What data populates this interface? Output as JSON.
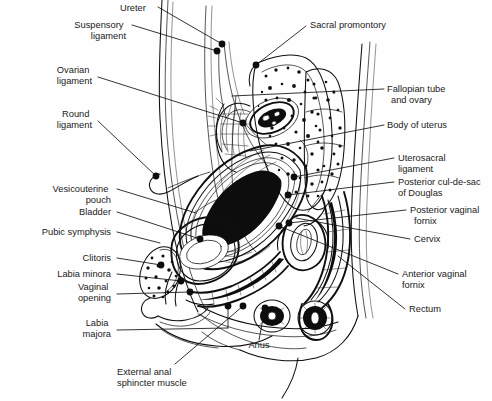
{
  "figure": {
    "caption_partial": "",
    "width": 492,
    "height": 401,
    "ink_color": "#0f0f0f",
    "background_color": "#fefefe",
    "text_color": "#1a1a1a"
  },
  "labels_left": [
    {
      "id": "suspensory-ligament",
      "lines": [
        "Suspensory",
        "ligament"
      ],
      "x": 126,
      "y": 28,
      "anchor": "end"
    },
    {
      "id": "ovarian-ligament",
      "lines": [
        "Ovarian",
        "ligament"
      ],
      "x": 92,
      "y": 73,
      "anchor": "end"
    },
    {
      "id": "round-ligament",
      "lines": [
        "Round",
        "ligament"
      ],
      "x": 92,
      "y": 117,
      "anchor": "end"
    },
    {
      "id": "vesicouterine-pouch",
      "lines": [
        "Vesicouterine",
        "pouch"
      ],
      "x": 111,
      "y": 192,
      "anchor": "end"
    },
    {
      "id": "bladder",
      "lines": [
        "Bladder"
      ],
      "x": 111,
      "y": 215,
      "anchor": "end"
    },
    {
      "id": "pubic-symphysis",
      "lines": [
        "Pubic symphysis"
      ],
      "x": 111,
      "y": 235,
      "anchor": "end"
    },
    {
      "id": "clitoris",
      "lines": [
        "Clitoris"
      ],
      "x": 111,
      "y": 261,
      "anchor": "end"
    },
    {
      "id": "labia-minora",
      "lines": [
        "Labia minora"
      ],
      "x": 111,
      "y": 277,
      "anchor": "end"
    },
    {
      "id": "vaginal-opening",
      "lines": [
        "Vaginal",
        "opening"
      ],
      "x": 111,
      "y": 290,
      "anchor": "end"
    },
    {
      "id": "labia-majora",
      "lines": [
        "Labia",
        "majora"
      ],
      "x": 111,
      "y": 326,
      "anchor": "end"
    }
  ],
  "labels_top": [
    {
      "id": "ureter",
      "lines": [
        "Ureter"
      ],
      "x": 120,
      "y": 11,
      "anchor": "start"
    },
    {
      "id": "sacral-promontory",
      "lines": [
        "Sacral promontory"
      ],
      "x": 310,
      "y": 28,
      "anchor": "start"
    }
  ],
  "labels_right": [
    {
      "id": "fallopian-tube-and-ovary",
      "lines": [
        "Fallopian tube",
        "and ovary"
      ],
      "x": 387,
      "y": 92,
      "anchor": "start"
    },
    {
      "id": "body-of-uterus",
      "lines": [
        "Body of uterus"
      ],
      "x": 387,
      "y": 128,
      "anchor": "start"
    },
    {
      "id": "uterosacral-ligament",
      "lines": [
        "Uterosacral",
        "ligament"
      ],
      "x": 398,
      "y": 161,
      "anchor": "start"
    },
    {
      "id": "posterior-cul-de-sac-of-douglas",
      "lines": [
        "Posterior cul-de-sac",
        "of Douglas"
      ],
      "x": 398,
      "y": 185,
      "anchor": "start"
    },
    {
      "id": "posterior-vaginal-fornix",
      "lines": [
        "Posterior vaginal",
        "fornix"
      ],
      "x": 410,
      "y": 213,
      "anchor": "start"
    },
    {
      "id": "cervix",
      "lines": [
        "Cervix"
      ],
      "x": 414,
      "y": 242,
      "anchor": "start"
    },
    {
      "id": "anterior-vaginal-fornix",
      "lines": [
        "Anterior vaginal",
        "fornix"
      ],
      "x": 402,
      "y": 277,
      "anchor": "start"
    },
    {
      "id": "rectum",
      "lines": [
        "Rectum"
      ],
      "x": 409,
      "y": 312,
      "anchor": "start"
    }
  ],
  "labels_bottom": [
    {
      "id": "anus",
      "lines": [
        "Anus"
      ],
      "x": 259,
      "y": 348,
      "anchor": "middle"
    },
    {
      "id": "external-anal-sphincter-muscle",
      "lines": [
        "External anal",
        "sphincter muscle"
      ],
      "x": 117,
      "y": 375,
      "anchor": "start"
    }
  ],
  "structures": [
    {
      "id": "sacrum",
      "name": "sacrum"
    },
    {
      "id": "coccyx",
      "name": "coccyx"
    },
    {
      "id": "uterus",
      "name": "uterus"
    },
    {
      "id": "vagina",
      "name": "vagina"
    },
    {
      "id": "bladder-organ",
      "name": "bladder"
    },
    {
      "id": "rectum-organ",
      "name": "rectum"
    },
    {
      "id": "pubic-bone",
      "name": "pubic bone"
    },
    {
      "id": "abdominal-wall",
      "name": "abdominal wall"
    },
    {
      "id": "buttock-contour",
      "name": "buttock contour"
    },
    {
      "id": "thigh-contour",
      "name": "thigh contour"
    }
  ]
}
